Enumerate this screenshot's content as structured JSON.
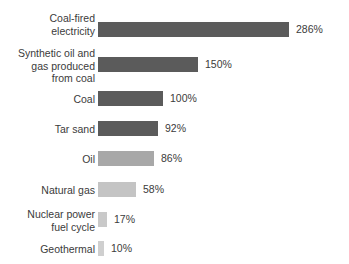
{
  "chart_data": {
    "type": "bar",
    "orientation": "horizontal",
    "title": "",
    "subtitle": "",
    "xlabel": "",
    "ylabel": "",
    "grid": false,
    "legend": "none",
    "axis_visible": false,
    "unit": "%",
    "xlim": [
      0,
      286
    ],
    "categories": [
      "Coal-fired\nelectricity",
      "Synthetic oil and\ngas produced\nfrom coal",
      "Coal",
      "Tar sand",
      "Oil",
      "Natural gas",
      "Nuclear power\nfuel cycle",
      "Geothermal"
    ],
    "values": [
      286,
      150,
      100,
      92,
      86,
      58,
      17,
      10
    ],
    "value_labels": [
      "286%",
      "150%",
      "100%",
      "92%",
      "86%",
      "58%",
      "17%",
      "10%"
    ],
    "bar_colors": [
      "#5b5b5b",
      "#5b5b5b",
      "#5b5b5b",
      "#5b5b5b",
      "#a8a8a8",
      "#c4c4c4",
      "#c9c9c9",
      "#cfcfcf"
    ]
  },
  "rows": [
    {
      "label": "Coal-fired\nelectricity",
      "value_label": "286%",
      "value": 286,
      "color": "#5b5b5b",
      "top": 22,
      "label_top": 12,
      "width": 191
    },
    {
      "label": "Synthetic oil and\ngas produced\nfrom coal",
      "value_label": "150%",
      "value": 150,
      "color": "#5b5b5b",
      "top": 57,
      "label_top": 47,
      "width": 100
    },
    {
      "label": "Coal",
      "value_label": "100%",
      "value": 100,
      "color": "#5b5b5b",
      "top": 91,
      "label_top": 93,
      "width": 65
    },
    {
      "label": "Tar sand",
      "value_label": "92%",
      "value": 92,
      "color": "#5b5b5b",
      "top": 121,
      "label_top": 123,
      "width": 60
    },
    {
      "label": "Oil",
      "value_label": "86%",
      "value": 86,
      "color": "#a8a8a8",
      "top": 151,
      "label_top": 153,
      "width": 56
    },
    {
      "label": "Natural gas",
      "value_label": "58%",
      "value": 58,
      "color": "#c4c4c4",
      "top": 182,
      "label_top": 184,
      "width": 38
    },
    {
      "label": "Nuclear power\nfuel cycle",
      "value_label": "17%",
      "value": 17,
      "color": "#c9c9c9",
      "top": 212,
      "label_top": 208,
      "width": 9
    },
    {
      "label": "Geothermal",
      "value_label": "10%",
      "value": 10,
      "color": "#cfcfcf",
      "top": 241,
      "label_top": 243,
      "width": 6
    }
  ]
}
